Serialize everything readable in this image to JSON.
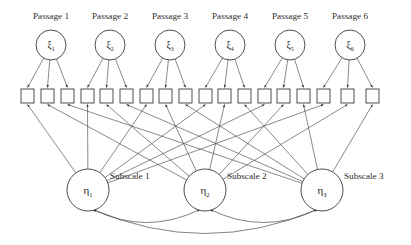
{
  "diagram": {
    "type": "structural-equation-model-path-diagram",
    "background_color": "#ffffff",
    "line_color": "#4a4a4a",
    "node_stroke_color": "#3a3a3a",
    "node_fill_color": "#ffffff",
    "text_color": "#2b2b2b"
  },
  "exogenous_factors": [
    {
      "label": "Passage 1",
      "symbol": "ξ",
      "subscript": "1",
      "cx": 51,
      "cy": 45,
      "r": 15
    },
    {
      "label": "Passage 2",
      "symbol": "ξ",
      "subscript": "2",
      "cx": 110,
      "cy": 45,
      "r": 15
    },
    {
      "label": "Passage 3",
      "symbol": "ξ",
      "subscript": "3",
      "cx": 170,
      "cy": 45,
      "r": 15
    },
    {
      "label": "Passage 4",
      "symbol": "ξ",
      "subscript": "4",
      "cx": 230,
      "cy": 45,
      "r": 15
    },
    {
      "label": "Passage 5",
      "symbol": "ξ",
      "subscript": "5",
      "cx": 290,
      "cy": 45,
      "r": 15
    },
    {
      "label": "Passage 6",
      "symbol": "ξ",
      "subscript": "6",
      "cx": 350,
      "cy": 45,
      "r": 15
    }
  ],
  "indicators": {
    "count": 18,
    "per_passage": 3,
    "width": 13,
    "height": 14,
    "top": 89,
    "x_positions": [
      21,
      41,
      61,
      81,
      100,
      120,
      140,
      159,
      179,
      199,
      218,
      238,
      258,
      277,
      297,
      317,
      341,
      366
    ],
    "labels": [
      "",
      "",
      "",
      "",
      "",
      "",
      "",
      "",
      "",
      "",
      "",
      "",
      "",
      "",
      "",
      "",
      "",
      ""
    ]
  },
  "endogenous_factors": [
    {
      "label": "Subscale 1",
      "symbol": "η",
      "subscript": "1",
      "cx": 88,
      "cy": 190,
      "r": 21,
      "label_x": 110
    },
    {
      "label": "Subscale 2",
      "symbol": "η",
      "subscript": "2",
      "cx": 205,
      "cy": 190,
      "r": 21,
      "label_x": 227
    },
    {
      "label": "Subscale 3",
      "symbol": "η",
      "subscript": "3",
      "cx": 322,
      "cy": 190,
      "r": 21,
      "label_x": 344
    }
  ],
  "loadings_xi_to_indicators": [
    {
      "from": 0,
      "to": [
        0,
        1,
        2
      ]
    },
    {
      "from": 1,
      "to": [
        3,
        4,
        5
      ]
    },
    {
      "from": 2,
      "to": [
        6,
        7,
        8
      ]
    },
    {
      "from": 3,
      "to": [
        9,
        10,
        11
      ]
    },
    {
      "from": 4,
      "to": [
        12,
        13,
        14
      ]
    },
    {
      "from": 5,
      "to": [
        15,
        16,
        17
      ]
    }
  ],
  "loadings_eta_to_indicators": [
    {
      "from": 0,
      "to": [
        0,
        3,
        6,
        9,
        12,
        15
      ]
    },
    {
      "from": 1,
      "to": [
        1,
        4,
        7,
        10,
        13,
        16
      ]
    },
    {
      "from": 2,
      "to": [
        2,
        5,
        8,
        11,
        14,
        17
      ]
    }
  ],
  "correlations": [
    {
      "between": [
        0,
        1
      ],
      "sag": 26,
      "double_headed": true
    },
    {
      "between": [
        1,
        2
      ],
      "sag": 26,
      "double_headed": true
    },
    {
      "between": [
        0,
        2
      ],
      "sag": 48,
      "double_headed": true
    }
  ]
}
